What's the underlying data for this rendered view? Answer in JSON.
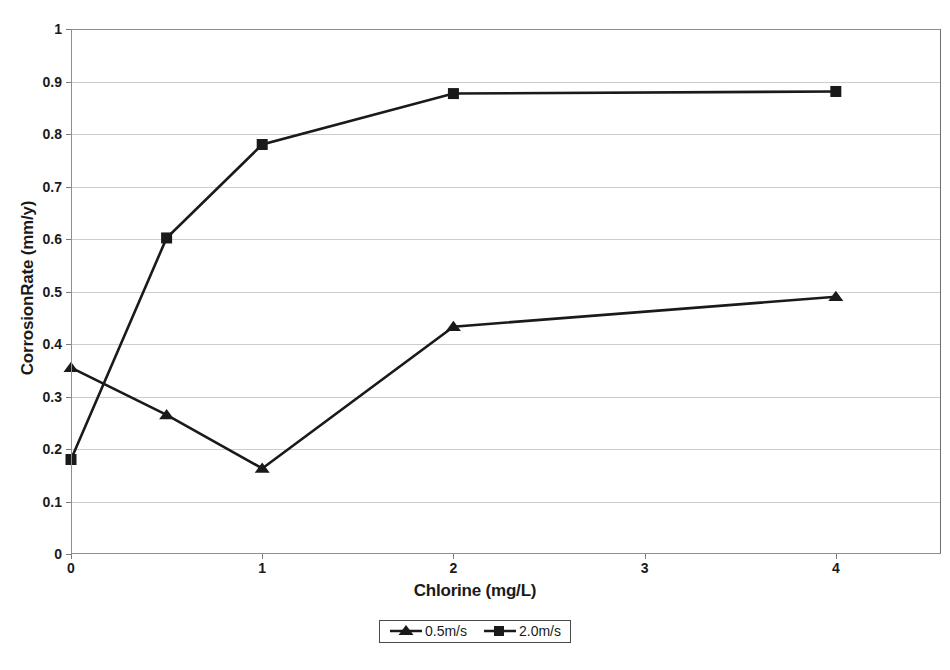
{
  "chart_data": {
    "type": "line",
    "title": "",
    "xlabel": "Chlorine (mg/L)",
    "ylabel": "CorrosionRate (mm/y)",
    "xlim": [
      0,
      4.55
    ],
    "ylim": [
      0,
      1
    ],
    "grid": true,
    "legend_position": "bottom",
    "xticks": [
      0,
      1,
      2,
      3,
      4
    ],
    "xtick_labels": [
      "0",
      "1",
      "2",
      "3",
      "4"
    ],
    "yticks": [
      0,
      0.1,
      0.2,
      0.3,
      0.4,
      0.5,
      0.6,
      0.7,
      0.8,
      0.9,
      1
    ],
    "ytick_labels": [
      "0",
      "0.1",
      "0.2",
      "0.3",
      "0.4",
      "0.5",
      "0.6",
      "0.7",
      "0.8",
      "0.9",
      "1"
    ],
    "x": [
      0,
      0.5,
      1,
      2,
      4
    ],
    "series": [
      {
        "name": "0.5m/s",
        "marker": "triangle",
        "color": "#1a1a1a",
        "values": [
          0.355,
          0.265,
          0.163,
          0.433,
          0.49
        ]
      },
      {
        "name": "2.0m/s",
        "marker": "square",
        "color": "#1a1a1a",
        "values": [
          0.18,
          0.602,
          0.78,
          0.877,
          0.881
        ]
      }
    ]
  },
  "legend": {
    "entries": [
      {
        "label": "0.5m/s",
        "marker": "triangle-marker-icon"
      },
      {
        "label": "2.0m/s",
        "marker": "square-marker-icon"
      }
    ]
  },
  "colors": {
    "line": "#1a1a1a",
    "grid": "#cdcdcd",
    "frame": "#8e8e8e",
    "text": "#1a1a1a",
    "background": "#ffffff"
  }
}
